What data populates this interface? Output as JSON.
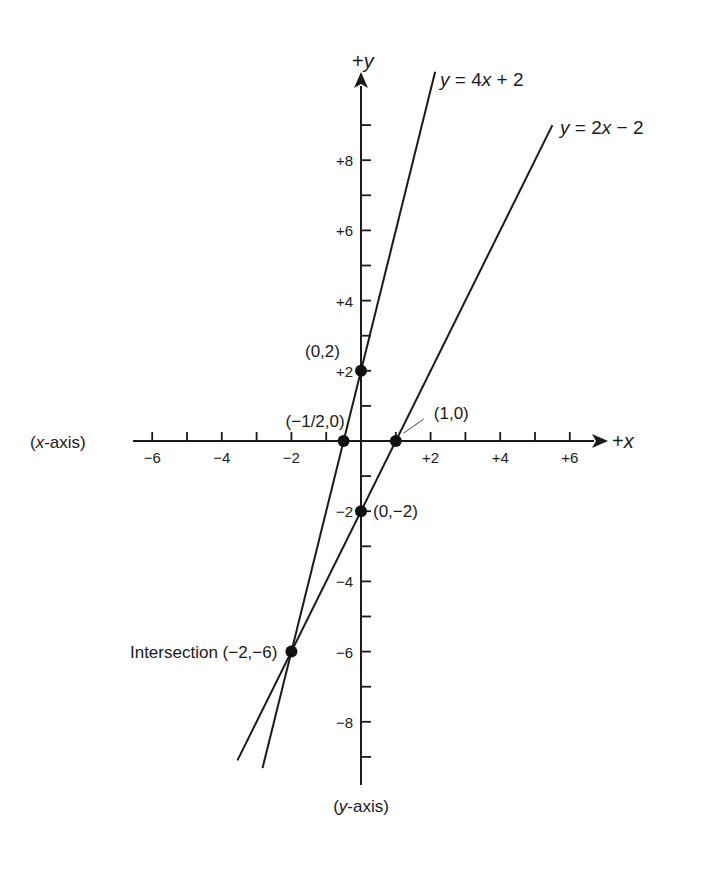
{
  "chart_data": {
    "type": "line",
    "title": "",
    "xlabel": "(x-axis)",
    "ylabel": "(y-axis)",
    "x_end_label": "+x",
    "y_end_label": "+y",
    "xlim": [
      -6.2,
      6.5
    ],
    "ylim": [
      -9.8,
      10.5
    ],
    "grid": false,
    "x_ticks": [
      -6,
      -5,
      -4,
      -3,
      -2,
      -1,
      1,
      2,
      3,
      4,
      5,
      6
    ],
    "x_tick_labels": [
      {
        "value": -6,
        "label": "−6"
      },
      {
        "value": -4,
        "label": "−4"
      },
      {
        "value": -2,
        "label": "−2"
      },
      {
        "value": 2,
        "label": "+2"
      },
      {
        "value": 4,
        "label": "+4"
      },
      {
        "value": 6,
        "label": "+6"
      }
    ],
    "y_ticks": [
      -9,
      -8,
      -7,
      -6,
      -5,
      -4,
      -3,
      -2,
      -1,
      1,
      2,
      3,
      4,
      5,
      6,
      7,
      8,
      9
    ],
    "y_tick_labels": [
      {
        "value": 8,
        "label": "+8"
      },
      {
        "value": 6,
        "label": "+6"
      },
      {
        "value": 4,
        "label": "+4"
      },
      {
        "value": 2,
        "label": "+2"
      },
      {
        "value": -2,
        "label": "−2"
      },
      {
        "value": -4,
        "label": "−4"
      },
      {
        "value": -6,
        "label": "−6"
      },
      {
        "value": -8,
        "label": "−8"
      }
    ],
    "series": [
      {
        "name": "y = 4x + 2",
        "slope": 4,
        "intercept": 2,
        "x_range": [
          -2.83,
          2.13
        ]
      },
      {
        "name": "y = 2x − 2",
        "slope": 2,
        "intercept": -2,
        "x_range": [
          -3.55,
          5.5
        ]
      }
    ],
    "points": [
      {
        "x": 0,
        "y": 2,
        "label": "(0,2)"
      },
      {
        "x": -0.5,
        "y": 0,
        "label": "(−1/2,0)"
      },
      {
        "x": 1,
        "y": 0,
        "label": "(1,0)"
      },
      {
        "x": 0,
        "y": -2,
        "label": "(0,−2)"
      },
      {
        "x": -2,
        "y": -6,
        "label": "Intersection (−2,−6)"
      }
    ]
  }
}
